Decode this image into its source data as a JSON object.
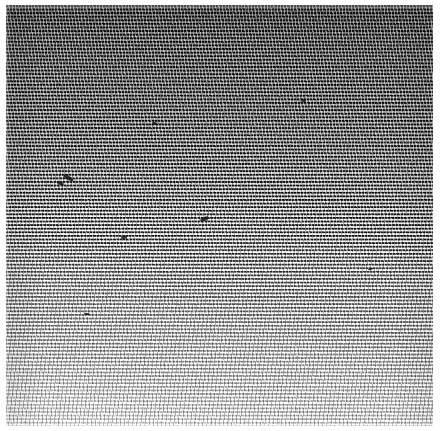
{
  "image": {
    "title": "Halftone screened grayscale plate",
    "kind": "scanned-halftone-texture",
    "caption": "",
    "width_px": 441,
    "height_px": 431,
    "colors": {
      "page_background": "#ffffff",
      "darkest_tone": "#3c3c3c",
      "lightest_tone": "#d8d8d8",
      "mid_tone": "#8d8d8d",
      "defect_ink": "#1a1a1a"
    },
    "plate": {
      "left_px": 6,
      "top_px": 5,
      "width_px": 427,
      "height_px": 421,
      "margin_label": "white page margin"
    },
    "screen": {
      "pattern": "horizontal dashed line screen",
      "row_pitch_px": 3.6,
      "dash_pitch_px": 3.2,
      "row_tilt_deg": -0.6,
      "description": "rows of short dark dashes on a light ground"
    },
    "tone_gradient": {
      "direction": "top-to-bottom",
      "description": "dense dark screen at top fading progressively to a light open screen at the bottom",
      "stops": [
        {
          "position_pct": 0,
          "color": "#3c3c3c"
        },
        {
          "position_pct": 14,
          "color": "#4c4c4c"
        },
        {
          "position_pct": 34,
          "color": "#636363"
        },
        {
          "position_pct": 53,
          "color": "#818181"
        },
        {
          "position_pct": 70,
          "color": "#a1a1a1"
        },
        {
          "position_pct": 85,
          "color": "#bdbdbd"
        },
        {
          "position_pct": 100,
          "color": "#d8d8d8"
        }
      ]
    },
    "defects": [
      {
        "name": "defect-mark-1",
        "x_px": 63,
        "y_px": 176,
        "w_px": 11,
        "h_px": 4,
        "rotate_deg": 28
      },
      {
        "name": "defect-mark-2",
        "x_px": 57,
        "y_px": 182,
        "w_px": 7,
        "h_px": 3,
        "rotate_deg": 18
      },
      {
        "name": "defect-mark-3",
        "x_px": 200,
        "y_px": 217,
        "w_px": 9,
        "h_px": 4,
        "rotate_deg": -22
      },
      {
        "name": "defect-mark-4",
        "x_px": 152,
        "y_px": 122,
        "w_px": 5,
        "h_px": 3,
        "rotate_deg": 10
      },
      {
        "name": "defect-mark-5",
        "x_px": 121,
        "y_px": 236,
        "w_px": 6,
        "h_px": 3,
        "rotate_deg": -8
      },
      {
        "name": "defect-mark-6",
        "x_px": 301,
        "y_px": 99,
        "w_px": 5,
        "h_px": 3,
        "rotate_deg": 14
      },
      {
        "name": "defect-mark-7",
        "x_px": 368,
        "y_px": 268,
        "w_px": 5,
        "h_px": 2,
        "rotate_deg": -12
      },
      {
        "name": "defect-mark-8",
        "x_px": 84,
        "y_px": 313,
        "w_px": 6,
        "h_px": 2,
        "rotate_deg": 6
      }
    ]
  }
}
